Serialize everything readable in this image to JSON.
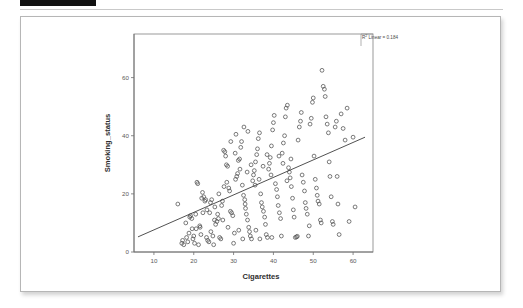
{
  "page": {
    "redaction_bar": "",
    "background_color": "#ffffff"
  },
  "figure": {
    "card_border_color": "#b6b6b6",
    "annotation": {
      "r2_prefix": "R",
      "r2_superscript": "2",
      "r2_text": " Linear = 0.184"
    }
  },
  "chart_data": {
    "type": "scatter",
    "title": "",
    "subtitle": "",
    "xlabel": "Cigarettes",
    "ylabel": "Smoking_status",
    "xticks": [
      10,
      20,
      30,
      40,
      50,
      60
    ],
    "yticks": [
      0,
      20,
      40,
      60
    ],
    "xlim": [
      5,
      65
    ],
    "ylim": [
      0,
      75
    ],
    "grid": false,
    "legend_position": "top-right",
    "annotations": [
      "R² Linear = 0.184"
    ],
    "marker_style": "open-circle",
    "marker_color": "#4f4f4f",
    "fit": {
      "type": "linear",
      "r_squared": 0.184,
      "line_color": "#3d3d3d",
      "x_start": 6.0,
      "y_start": 5.2,
      "x_end": 63.0,
      "y_end": 39.5
    },
    "points": [
      [
        16.0,
        16.5
      ],
      [
        17.0,
        3.0
      ],
      [
        17.2,
        4.0
      ],
      [
        17.5,
        2.5
      ],
      [
        18.0,
        10.0
      ],
      [
        18.2,
        5.0
      ],
      [
        18.5,
        3.5
      ],
      [
        18.8,
        6.5
      ],
      [
        19.0,
        12.0
      ],
      [
        19.2,
        12.5
      ],
      [
        19.5,
        11.5
      ],
      [
        19.8,
        4.5
      ],
      [
        20.0,
        5.5
      ],
      [
        20.2,
        3.0
      ],
      [
        20.5,
        13.0
      ],
      [
        20.8,
        24.0
      ],
      [
        21.0,
        23.5
      ],
      [
        21.2,
        2.5
      ],
      [
        21.5,
        9.0
      ],
      [
        21.8,
        6.0
      ],
      [
        22.0,
        18.5
      ],
      [
        22.2,
        20.5
      ],
      [
        22.5,
        19.0
      ],
      [
        22.8,
        17.5
      ],
      [
        23.0,
        18.0
      ],
      [
        23.2,
        5.0
      ],
      [
        23.5,
        4.0
      ],
      [
        23.8,
        3.5
      ],
      [
        24.0,
        13.5
      ],
      [
        24.2,
        17.0
      ],
      [
        24.5,
        18.0
      ],
      [
        24.8,
        5.5
      ],
      [
        25.0,
        2.5
      ],
      [
        25.2,
        11.0
      ],
      [
        25.5,
        9.5
      ],
      [
        25.8,
        10.5
      ],
      [
        26.0,
        13.0
      ],
      [
        26.2,
        11.5
      ],
      [
        26.5,
        5.0
      ],
      [
        26.8,
        4.5
      ],
      [
        27.0,
        16.0
      ],
      [
        27.2,
        17.5
      ],
      [
        27.5,
        35.0
      ],
      [
        27.8,
        34.5
      ],
      [
        28.0,
        33.0
      ],
      [
        28.2,
        30.0
      ],
      [
        28.5,
        29.5
      ],
      [
        28.8,
        22.0
      ],
      [
        29.0,
        21.0
      ],
      [
        29.2,
        14.0
      ],
      [
        29.5,
        13.5
      ],
      [
        29.8,
        12.5
      ],
      [
        30.0,
        3.0
      ],
      [
        30.2,
        6.5
      ],
      [
        30.5,
        25.0
      ],
      [
        30.8,
        26.0
      ],
      [
        31.0,
        27.0
      ],
      [
        31.2,
        31.5
      ],
      [
        31.5,
        32.0
      ],
      [
        31.8,
        36.0
      ],
      [
        32.0,
        38.0
      ],
      [
        32.2,
        23.0
      ],
      [
        32.5,
        19.5
      ],
      [
        32.8,
        18.0
      ],
      [
        32.9,
        16.5
      ],
      [
        33.0,
        15.0
      ],
      [
        33.2,
        13.0
      ],
      [
        33.5,
        11.0
      ],
      [
        33.8,
        8.5
      ],
      [
        34.0,
        7.0
      ],
      [
        34.2,
        5.5
      ],
      [
        34.5,
        4.5
      ],
      [
        34.8,
        24.5
      ],
      [
        35.0,
        26.5
      ],
      [
        35.2,
        28.0
      ],
      [
        35.5,
        31.0
      ],
      [
        35.8,
        33.5
      ],
      [
        36.0,
        35.5
      ],
      [
        36.2,
        39.0
      ],
      [
        36.5,
        41.0
      ],
      [
        36.8,
        20.0
      ],
      [
        37.0,
        17.0
      ],
      [
        37.2,
        15.5
      ],
      [
        37.5,
        14.0
      ],
      [
        37.8,
        12.0
      ],
      [
        38.0,
        9.5
      ],
      [
        38.2,
        6.0
      ],
      [
        38.5,
        5.0
      ],
      [
        38.8,
        28.5
      ],
      [
        39.0,
        30.5
      ],
      [
        39.2,
        32.5
      ],
      [
        39.5,
        36.5
      ],
      [
        39.8,
        42.0
      ],
      [
        40.0,
        44.5
      ],
      [
        40.2,
        47.0
      ],
      [
        40.5,
        23.5
      ],
      [
        40.8,
        21.5
      ],
      [
        41.0,
        19.0
      ],
      [
        41.2,
        16.0
      ],
      [
        41.5,
        13.5
      ],
      [
        41.8,
        11.5
      ],
      [
        42.0,
        5.5
      ],
      [
        42.2,
        34.0
      ],
      [
        42.5,
        37.5
      ],
      [
        42.8,
        40.0
      ],
      [
        43.0,
        46.5
      ],
      [
        43.2,
        49.5
      ],
      [
        43.5,
        50.5
      ],
      [
        43.8,
        29.0
      ],
      [
        44.0,
        27.5
      ],
      [
        44.2,
        25.5
      ],
      [
        44.5,
        22.5
      ],
      [
        44.8,
        18.5
      ],
      [
        45.0,
        14.5
      ],
      [
        45.2,
        12.0
      ],
      [
        45.5,
        5.0
      ],
      [
        45.8,
        5.2
      ],
      [
        46.0,
        5.4
      ],
      [
        46.2,
        38.5
      ],
      [
        46.5,
        43.0
      ],
      [
        46.8,
        45.0
      ],
      [
        47.0,
        48.0
      ],
      [
        47.2,
        26.5
      ],
      [
        47.5,
        24.0
      ],
      [
        47.8,
        21.0
      ],
      [
        48.0,
        17.0
      ],
      [
        48.2,
        15.0
      ],
      [
        48.5,
        13.0
      ],
      [
        48.8,
        5.5
      ],
      [
        49.0,
        9.0
      ],
      [
        49.2,
        44.0
      ],
      [
        49.5,
        46.0
      ],
      [
        49.8,
        51.5
      ],
      [
        50.0,
        53.0
      ],
      [
        50.2,
        33.0
      ],
      [
        50.5,
        25.0
      ],
      [
        50.8,
        22.0
      ],
      [
        51.0,
        19.5
      ],
      [
        51.2,
        17.5
      ],
      [
        51.5,
        16.5
      ],
      [
        51.8,
        11.0
      ],
      [
        52.0,
        10.0
      ],
      [
        52.2,
        62.5
      ],
      [
        52.5,
        57.0
      ],
      [
        52.8,
        56.0
      ],
      [
        53.0,
        53.5
      ],
      [
        53.2,
        46.5
      ],
      [
        53.5,
        44.0
      ],
      [
        53.8,
        41.0
      ],
      [
        54.0,
        31.0
      ],
      [
        54.2,
        26.0
      ],
      [
        54.5,
        19.0
      ],
      [
        54.8,
        10.5
      ],
      [
        55.0,
        9.5
      ],
      [
        55.5,
        43.0
      ],
      [
        55.8,
        45.0
      ],
      [
        56.0,
        26.0
      ],
      [
        56.2,
        16.5
      ],
      [
        56.5,
        6.0
      ],
      [
        57.0,
        47.5
      ],
      [
        57.5,
        42.5
      ],
      [
        58.0,
        38.5
      ],
      [
        58.5,
        49.5
      ],
      [
        59.0,
        10.5
      ],
      [
        60.0,
        39.5
      ],
      [
        60.5,
        15.5
      ],
      [
        26.3,
        20.0
      ],
      [
        27.6,
        22.5
      ],
      [
        28.3,
        24.0
      ],
      [
        30.4,
        34.0
      ],
      [
        31.6,
        28.5
      ],
      [
        33.4,
        27.5
      ],
      [
        34.4,
        30.0
      ],
      [
        35.4,
        23.0
      ],
      [
        36.4,
        25.0
      ],
      [
        37.4,
        29.5
      ],
      [
        38.4,
        33.5
      ],
      [
        39.4,
        26.5
      ],
      [
        41.4,
        33.0
      ],
      [
        42.4,
        30.5
      ],
      [
        43.4,
        24.5
      ],
      [
        44.4,
        32.0
      ],
      [
        29.3,
        38.0
      ],
      [
        30.6,
        40.5
      ],
      [
        32.6,
        43.0
      ],
      [
        33.6,
        41.5
      ],
      [
        27.3,
        11.0
      ],
      [
        28.6,
        8.5
      ],
      [
        31.3,
        7.5
      ],
      [
        32.3,
        4.5
      ],
      [
        35.6,
        7.5
      ],
      [
        36.6,
        4.5
      ],
      [
        39.6,
        5.0
      ],
      [
        22.3,
        13.5
      ],
      [
        23.3,
        14.5
      ],
      [
        24.3,
        7.0
      ],
      [
        25.3,
        15.5
      ],
      [
        20.6,
        8.0
      ],
      [
        21.6,
        8.5
      ],
      [
        19.6,
        8.0
      ]
    ]
  }
}
